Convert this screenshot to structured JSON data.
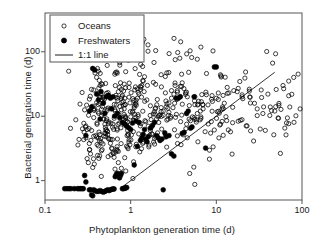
{
  "figure": {
    "background": "#ffffff",
    "frame_color": "#555555",
    "marker_color": "#000000"
  },
  "chart_data": {
    "type": "scatter",
    "title": "",
    "xlabel": "Phytoplankton generation time (d)",
    "ylabel": "Bacterial generation time (d)",
    "xscale": "log",
    "yscale": "log",
    "xlim": [
      0.1,
      100
    ],
    "ylim": [
      0.5,
      400
    ],
    "xticks": [
      0.1,
      1,
      10,
      100
    ],
    "xticklabels": [
      "0.1",
      "1",
      "10",
      "100"
    ],
    "yticks": [
      1,
      10,
      100
    ],
    "yticklabels": [
      "1",
      "10",
      "100"
    ],
    "grid": false,
    "legend": {
      "position": "upper-left",
      "entries": [
        {
          "label": "Oceans",
          "marker": "open-circle"
        },
        {
          "label": "Freshwaters",
          "marker": "filled-circle"
        },
        {
          "label": "1:1 line",
          "marker": "line"
        }
      ]
    },
    "annotations": [
      {
        "name": "one-to-one-line",
        "label": "1:1 line",
        "from": [
          0.78,
          0.78
        ],
        "to": [
          48,
          48
        ]
      }
    ],
    "series": [
      {
        "name": "Oceans",
        "marker": "open-circle",
        "n": 430,
        "points": [
          [
            0.3,
            4.6
          ],
          [
            0.31,
            2.2
          ],
          [
            0.32,
            1.9
          ],
          [
            0.33,
            3.0
          ],
          [
            0.34,
            2.6
          ],
          [
            0.35,
            6.0
          ],
          [
            0.36,
            1.6
          ],
          [
            0.37,
            9.5
          ],
          [
            0.38,
            13
          ],
          [
            0.39,
            5.0
          ],
          [
            0.4,
            40
          ],
          [
            0.41,
            55
          ],
          [
            0.42,
            50
          ],
          [
            0.43,
            36
          ],
          [
            0.44,
            30
          ],
          [
            0.45,
            22
          ],
          [
            0.46,
            18
          ],
          [
            0.47,
            14
          ],
          [
            0.48,
            11
          ],
          [
            0.49,
            9.0
          ],
          [
            0.5,
            7.5
          ],
          [
            0.52,
            6.2
          ],
          [
            0.54,
            5.2
          ],
          [
            0.56,
            4.4
          ],
          [
            0.58,
            3.8
          ],
          [
            0.6,
            3.2
          ],
          [
            0.62,
            2.7
          ],
          [
            0.64,
            2.3
          ],
          [
            0.66,
            12
          ],
          [
            0.68,
            15
          ],
          [
            0.7,
            19
          ],
          [
            0.72,
            24
          ],
          [
            0.74,
            28
          ],
          [
            0.76,
            33
          ],
          [
            0.78,
            26
          ],
          [
            0.8,
            21
          ],
          [
            0.82,
            17
          ],
          [
            0.84,
            13
          ],
          [
            0.86,
            10
          ],
          [
            0.88,
            8.5
          ],
          [
            0.9,
            7.0
          ],
          [
            0.92,
            6.0
          ],
          [
            0.94,
            5.1
          ],
          [
            0.96,
            4.3
          ],
          [
            0.98,
            3.6
          ],
          [
            1.0,
            9.8
          ],
          [
            1.05,
            11.5
          ],
          [
            1.1,
            13.5
          ],
          [
            1.15,
            16
          ],
          [
            1.2,
            19
          ],
          [
            1.25,
            22
          ],
          [
            1.3,
            26
          ],
          [
            1.35,
            30
          ],
          [
            1.4,
            35
          ],
          [
            1.45,
            41
          ],
          [
            1.5,
            8.2
          ],
          [
            1.6,
            7.0
          ],
          [
            1.7,
            6.0
          ],
          [
            1.8,
            5.2
          ],
          [
            1.9,
            4.5
          ],
          [
            2.0,
            9.0
          ],
          [
            2.2,
            10.5
          ],
          [
            2.4,
            12
          ],
          [
            2.6,
            14
          ],
          [
            2.8,
            16
          ],
          [
            3.0,
            19
          ],
          [
            3.2,
            22
          ],
          [
            3.5,
            25
          ],
          [
            3.8,
            29
          ],
          [
            4.0,
            33
          ],
          [
            4.5,
            7.5
          ],
          [
            5.0,
            8.5
          ],
          [
            5.5,
            9.5
          ],
          [
            6.0,
            11
          ],
          [
            6.5,
            12
          ],
          [
            7.0,
            13
          ],
          [
            8.0,
            15
          ],
          [
            9.0,
            17
          ],
          [
            10,
            19
          ],
          [
            12,
            21
          ],
          [
            14,
            23
          ],
          [
            16,
            25
          ],
          [
            18,
            27
          ],
          [
            20,
            20
          ],
          [
            25,
            16
          ],
          [
            30,
            13
          ],
          [
            35,
            11
          ],
          [
            40,
            22
          ],
          [
            50,
            26
          ],
          [
            60,
            30
          ],
          [
            70,
            35
          ],
          [
            80,
            40
          ],
          [
            90,
            45
          ],
          [
            95,
            13
          ],
          [
            98,
            8
          ],
          [
            99,
            5
          ]
        ],
        "clusters": [
          {
            "cx_log": -0.3,
            "cy_log": 1.05,
            "sx": 0.16,
            "sy": 0.35,
            "n": 120
          },
          {
            "cx_log": 0.05,
            "cy_log": 0.95,
            "sx": 0.22,
            "sy": 0.38,
            "n": 110
          },
          {
            "cx_log": 0.55,
            "cy_log": 1.05,
            "sx": 0.28,
            "sy": 0.4,
            "n": 80
          },
          {
            "cx_log": 1.25,
            "cy_log": 1.15,
            "sx": 0.35,
            "sy": 0.35,
            "n": 70
          },
          {
            "cx_log": 0.3,
            "cy_log": 1.95,
            "sx": 0.45,
            "sy": 0.18,
            "n": 30
          },
          {
            "cx_log": 1.7,
            "cy_log": 1.1,
            "sx": 0.22,
            "sy": 0.3,
            "n": 25
          }
        ]
      },
      {
        "name": "Freshwaters",
        "marker": "filled-circle",
        "n": 115,
        "points": [
          [
            0.17,
            0.75
          ],
          [
            0.18,
            0.75
          ],
          [
            0.19,
            0.75
          ],
          [
            0.2,
            0.75
          ],
          [
            0.22,
            0.75
          ],
          [
            0.24,
            0.75
          ],
          [
            0.25,
            0.75
          ],
          [
            0.26,
            0.75
          ],
          [
            0.27,
            0.75
          ],
          [
            0.28,
            0.75
          ],
          [
            0.29,
            1.2
          ],
          [
            0.3,
            0.95
          ],
          [
            0.33,
            0.72
          ],
          [
            0.34,
            0.72
          ],
          [
            0.35,
            0.6
          ],
          [
            0.36,
            0.58
          ],
          [
            0.37,
            0.72
          ],
          [
            0.38,
            0.7
          ],
          [
            0.4,
            0.68
          ],
          [
            0.42,
            0.68
          ],
          [
            0.44,
            0.7
          ],
          [
            0.46,
            0.68
          ],
          [
            0.48,
            0.66
          ],
          [
            0.5,
            0.68
          ],
          [
            0.52,
            0.7
          ],
          [
            0.54,
            0.72
          ],
          [
            0.56,
            0.7
          ],
          [
            0.58,
            0.72
          ],
          [
            0.6,
            0.73
          ],
          [
            0.62,
            0.74
          ],
          [
            0.64,
            0.74
          ],
          [
            0.66,
            1.15
          ],
          [
            0.68,
            1.25
          ],
          [
            0.7,
            1.3
          ],
          [
            0.72,
            1.2
          ],
          [
            0.74,
            1.1
          ],
          [
            0.76,
            1.2
          ],
          [
            0.78,
            1.3
          ],
          [
            0.8,
            0.75
          ],
          [
            0.82,
            0.75
          ],
          [
            0.84,
            0.76
          ],
          [
            0.86,
            0.76
          ],
          [
            0.88,
            0.78
          ],
          [
            0.9,
            0.78
          ],
          [
            1.1,
            1.75
          ],
          [
            1.2,
            3.4
          ],
          [
            1.3,
            4.2
          ],
          [
            1.35,
            4.6
          ],
          [
            1.4,
            5.2
          ],
          [
            1.45,
            6.2
          ],
          [
            1.5,
            4.4
          ],
          [
            1.55,
            4.0
          ],
          [
            1.6,
            4.8
          ],
          [
            1.7,
            6.5
          ],
          [
            1.8,
            7.2
          ],
          [
            1.9,
            8.0
          ],
          [
            2.0,
            5.0
          ],
          [
            2.1,
            4.6
          ],
          [
            2.2,
            4.2
          ],
          [
            2.3,
            4.4
          ],
          [
            2.4,
            0.72
          ],
          [
            2.5,
            5.5
          ],
          [
            2.6,
            4.8
          ],
          [
            2.8,
            5.0
          ],
          [
            3.0,
            2.6
          ],
          [
            3.2,
            2.4
          ],
          [
            3.4,
            19
          ],
          [
            3.6,
            19
          ],
          [
            3.8,
            20
          ],
          [
            4.0,
            5.4
          ],
          [
            4.2,
            5.6
          ],
          [
            4.5,
            11
          ],
          [
            4.7,
            12
          ],
          [
            5.0,
            6.5
          ],
          [
            5.2,
            6.8
          ],
          [
            5.5,
            20
          ],
          [
            7.5,
            3.2
          ],
          [
            9.5,
            58
          ],
          [
            10,
            58
          ],
          [
            0.33,
            12
          ],
          [
            0.35,
            14
          ],
          [
            0.36,
            55
          ],
          [
            0.38,
            52
          ],
          [
            0.4,
            22
          ],
          [
            0.42,
            18
          ],
          [
            0.45,
            24
          ],
          [
            0.48,
            16
          ],
          [
            0.52,
            20
          ],
          [
            0.55,
            21
          ],
          [
            0.6,
            13
          ],
          [
            0.65,
            10
          ],
          [
            0.7,
            11
          ],
          [
            0.75,
            9.5
          ],
          [
            0.8,
            8.0
          ],
          [
            0.85,
            7.5
          ],
          [
            0.9,
            7.0
          ],
          [
            0.95,
            6.6
          ],
          [
            1.0,
            6.2
          ],
          [
            1.05,
            7.8
          ],
          [
            1.15,
            8.4
          ],
          [
            1.25,
            8.0
          ],
          [
            0.3,
            5.0
          ],
          [
            0.44,
            9.0
          ],
          [
            0.5,
            11
          ],
          [
            0.58,
            19
          ],
          [
            0.62,
            20
          ]
        ]
      }
    ]
  }
}
